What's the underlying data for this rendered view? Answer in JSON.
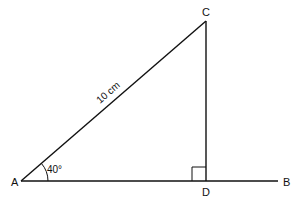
{
  "diagram": {
    "points": {
      "A": {
        "label": "A",
        "x": 21,
        "y": 181
      },
      "B": {
        "label": "B",
        "x": 278,
        "y": 181
      },
      "C": {
        "label": "C",
        "x": 206,
        "y": 21
      },
      "D": {
        "label": "D",
        "x": 206,
        "y": 181
      }
    },
    "angle_label": "40°",
    "hypotenuse_label": "10 cm",
    "right_angle_at": "D",
    "line_color": "#111111"
  }
}
